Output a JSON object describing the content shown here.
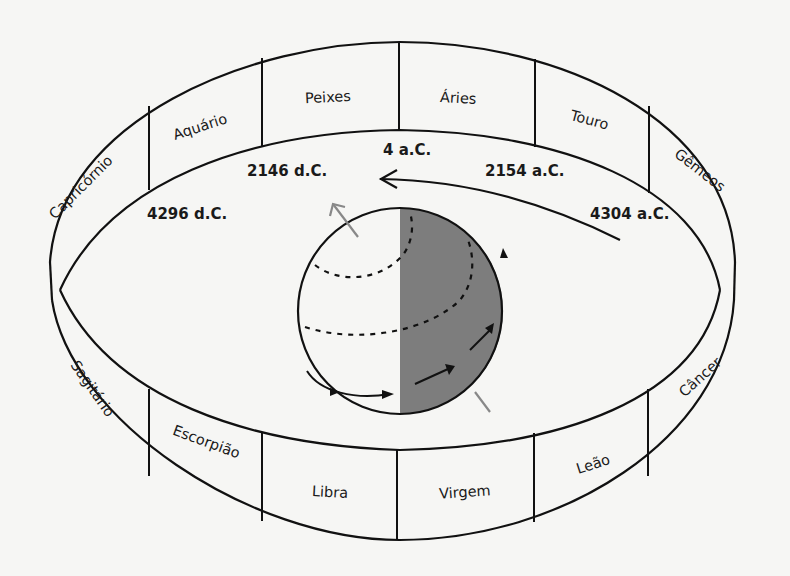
{
  "figure": {
    "type": "precession-zodiac-diagram",
    "colors": {
      "background": "#f6f6f4",
      "line": "#111111",
      "globe_shade": "#7d7d7d",
      "axis_arrow": "#888888"
    },
    "signs": [
      {
        "name": "Peixes"
      },
      {
        "name": "Áries"
      },
      {
        "name": "Touro"
      },
      {
        "name": "Gêmeos"
      },
      {
        "name": "Câncer"
      },
      {
        "name": "Leão"
      },
      {
        "name": "Virgem"
      },
      {
        "name": "Libra"
      },
      {
        "name": "Escorpião"
      },
      {
        "name": "Sagitário"
      },
      {
        "name": "Capricórnio"
      },
      {
        "name": "Aquário"
      }
    ],
    "dates": [
      {
        "label": "4 a.C."
      },
      {
        "label": "2146 d.C."
      },
      {
        "label": "2154 a.C."
      },
      {
        "label": "4296 d.C."
      },
      {
        "label": "4304 a.C."
      }
    ]
  }
}
